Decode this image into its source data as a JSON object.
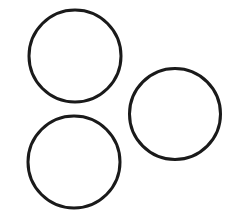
{
  "diagram": {
    "background": "#ffffff",
    "stroke_color": "#1a1a1a",
    "stroke_width": 3,
    "shapes": [
      {
        "type": "circle",
        "name": "circle-top-left",
        "cx": 75,
        "cy": 56,
        "r": 46
      },
      {
        "type": "circle",
        "name": "circle-bottom-left",
        "cx": 74,
        "cy": 162,
        "r": 46
      },
      {
        "type": "circle",
        "name": "circle-right",
        "cx": 175,
        "cy": 114,
        "r": 45.5
      }
    ]
  }
}
